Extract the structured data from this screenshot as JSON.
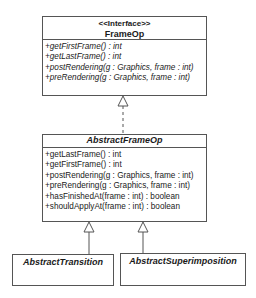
{
  "diagram": {
    "type": "UML class diagram",
    "classes": [
      {
        "id": "frameop",
        "stereotype": "<<Interface>>",
        "name": "FrameOp",
        "operations": [
          "+getFirstFrame() : int",
          "+getLastFrame() : int",
          "+postRendering(g : Graphics, frame : int)",
          "+preRendering(g : Graphics, frame : int)"
        ]
      },
      {
        "id": "abstractframeop",
        "name": "AbstractFrameOp",
        "operations": [
          "+getLastFrame() : int",
          "+getFirstFrame() : int",
          "+postRendering(g : Graphics, frame : int)",
          "+preRendering(g : Graphics, frame : int)",
          "+hasFinishedAt(frame : int) : boolean",
          "+shouldApplyAt(frame : int) : boolean"
        ]
      },
      {
        "id": "abstracttransition",
        "name": "AbstractTransition"
      },
      {
        "id": "abstractsuperimposition",
        "name": "AbstractSuperimposition"
      }
    ],
    "relations": [
      {
        "from": "AbstractFrameOp",
        "to": "FrameOp",
        "kind": "realization"
      },
      {
        "from": "AbstractTransition",
        "to": "AbstractFrameOp",
        "kind": "generalization"
      },
      {
        "from": "AbstractSuperimposition",
        "to": "AbstractFrameOp",
        "kind": "generalization"
      }
    ]
  }
}
